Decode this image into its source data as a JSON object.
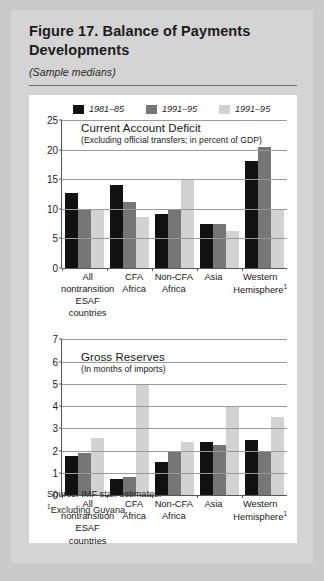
{
  "figure": {
    "title": "Figure 17.  Balance of Payments Developments",
    "subtitle": "(Sample medians)",
    "source": "Source: IMF staff estimates.",
    "footnote_marker": "1",
    "footnote": "Excluding Guyana."
  },
  "legend": {
    "items": [
      {
        "label": "1981–85",
        "color": "#111111"
      },
      {
        "label": "1991–95",
        "color": "#767676"
      },
      {
        "label": "1991–95",
        "color": "#d2d2d2"
      }
    ]
  },
  "colors": {
    "series1": "#111111",
    "series2": "#767676",
    "series3": "#d2d2d2",
    "panel_bg": "#ffffff",
    "page_bg": "#d4d4d4",
    "axis": "#555555",
    "grid": "#9a9a9a",
    "text": "#161616"
  },
  "chart_data": [
    {
      "type": "bar",
      "title": "Current Account Deficit",
      "subtitle": "(Excluding official transfers; in percent of  GDP)",
      "xlabel": "",
      "ylabel": "",
      "ylim": [
        0,
        25
      ],
      "yticks": [
        0,
        5,
        10,
        15,
        20,
        25
      ],
      "grid": true,
      "legend_position": "top",
      "categories": [
        "All nontransition ESAF countries",
        "CFA Africa",
        "Non-CFA Africa",
        "Asia",
        "Western Hemisphere"
      ],
      "series": [
        {
          "name": "1981–85",
          "values": [
            12.6,
            14.0,
            9.2,
            7.4,
            18.0
          ]
        },
        {
          "name": "1991–95",
          "values": [
            10.0,
            11.2,
            9.9,
            7.4,
            20.5
          ]
        },
        {
          "name": "1991–95",
          "values": [
            9.8,
            8.6,
            15.0,
            6.3,
            10.0
          ]
        }
      ]
    },
    {
      "type": "bar",
      "title": "Gross Reserves",
      "subtitle": "(In months of imports)",
      "xlabel": "",
      "ylabel": "",
      "ylim": [
        0,
        7
      ],
      "yticks": [
        0,
        1,
        2,
        3,
        4,
        5,
        6,
        7
      ],
      "grid": true,
      "legend_position": "top",
      "categories": [
        "All nontransition ESAF countries",
        "CFA Africa",
        "Non-CFA Africa",
        "Asia",
        "Western Hemisphere"
      ],
      "series": [
        {
          "name": "1981–85",
          "values": [
            1.75,
            0.75,
            1.5,
            2.4,
            2.5
          ]
        },
        {
          "name": "1991–95",
          "values": [
            1.9,
            0.8,
            2.0,
            2.25,
            2.0
          ]
        },
        {
          "name": "1991–95",
          "values": [
            2.55,
            5.0,
            2.4,
            4.0,
            3.5
          ]
        }
      ]
    }
  ],
  "xaxis_labels": [
    {
      "l1": "All",
      "l2": "nontransition",
      "l3": "ESAF countries",
      "sup": ""
    },
    {
      "l1": "CFA",
      "l2": "Africa",
      "l3": "",
      "sup": ""
    },
    {
      "l1": "Non-CFA",
      "l2": "Africa",
      "l3": "",
      "sup": ""
    },
    {
      "l1": "Asia",
      "l2": "",
      "l3": "",
      "sup": ""
    },
    {
      "l1": "Western",
      "l2": "Hemisphere",
      "l3": "",
      "sup": "1"
    }
  ]
}
